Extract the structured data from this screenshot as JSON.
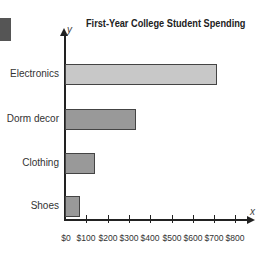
{
  "chart_data": {
    "type": "bar",
    "orientation": "horizontal",
    "title": "First-Year College Student Spending",
    "xlabel": "x",
    "ylabel": "y",
    "categories": [
      "Electronics",
      "Dorm decor",
      "Clothing",
      "Shoes"
    ],
    "values": [
      715,
      335,
      140,
      70
    ],
    "bar_colors": [
      "#c8c8c8",
      "#999999",
      "#999999",
      "#999999"
    ],
    "xlim": [
      0,
      800
    ],
    "x_ticks": [
      "$0",
      "$100",
      "$200",
      "$300",
      "$400",
      "$500",
      "$600",
      "$700",
      "$800"
    ],
    "grid": false,
    "legend": null
  }
}
